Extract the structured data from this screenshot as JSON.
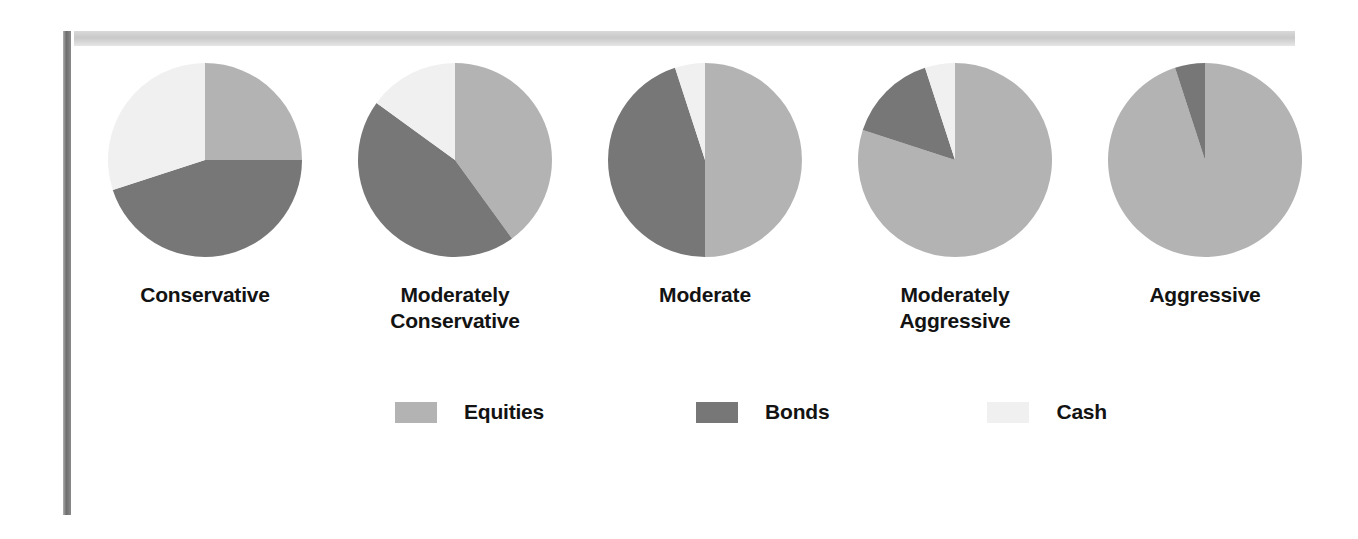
{
  "chart_data": {
    "type": "pie",
    "title": "",
    "legend_position": "bottom",
    "series_names": [
      "Equities",
      "Bonds",
      "Cash"
    ],
    "colors": {
      "Equities": "#b3b3b3",
      "Bonds": "#777777",
      "Cash": "#f0f0f0"
    },
    "pies": [
      {
        "label": "Conservative",
        "slices": [
          {
            "name": "Equities",
            "value": 25
          },
          {
            "name": "Bonds",
            "value": 45
          },
          {
            "name": "Cash",
            "value": 30
          }
        ]
      },
      {
        "label": "Moderately\nConservative",
        "slices": [
          {
            "name": "Equities",
            "value": 40
          },
          {
            "name": "Bonds",
            "value": 45
          },
          {
            "name": "Cash",
            "value": 15
          }
        ]
      },
      {
        "label": "Moderate",
        "slices": [
          {
            "name": "Equities",
            "value": 50
          },
          {
            "name": "Bonds",
            "value": 45
          },
          {
            "name": "Cash",
            "value": 5
          }
        ]
      },
      {
        "label": "Moderately\nAggressive",
        "slices": [
          {
            "name": "Equities",
            "value": 80
          },
          {
            "name": "Bonds",
            "value": 15
          },
          {
            "name": "Cash",
            "value": 5
          }
        ]
      },
      {
        "label": "Aggressive",
        "slices": [
          {
            "name": "Equities",
            "value": 95
          },
          {
            "name": "Bonds",
            "value": 5
          },
          {
            "name": "Cash",
            "value": 0
          }
        ]
      }
    ]
  },
  "legend": {
    "items": [
      {
        "label": "Equities",
        "color": "#b3b3b3"
      },
      {
        "label": "Bonds",
        "color": "#777777"
      },
      {
        "label": "Cash",
        "color": "#f0f0f0"
      }
    ]
  },
  "frame": {
    "top_rule_color": "#c9c9c9",
    "left_rule_color": "#6e6e6e"
  }
}
